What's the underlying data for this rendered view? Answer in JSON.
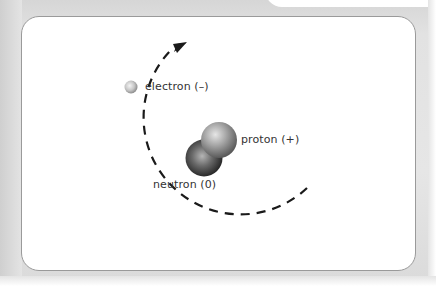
{
  "diagram": {
    "labels": {
      "electron": "electron (–)",
      "proton": "proton (+)",
      "neutron": "neutron (0)"
    },
    "colors": {
      "frame": "#e2e2e2",
      "panel_bg": "#ffffff",
      "panel_border": "#9a9a9a",
      "orbit": "#1a1a1a",
      "proton": "#8a8a8a",
      "neutron": "#4a4a4a",
      "electron": "#c8c8c8",
      "text": "#333333"
    },
    "orbit": {
      "style": "dashed",
      "direction": "clockwise arrow at top"
    }
  }
}
